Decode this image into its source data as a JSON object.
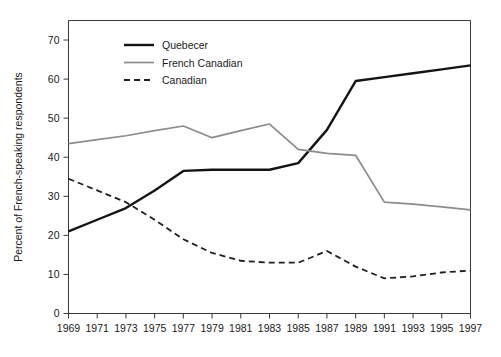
{
  "chart_data": {
    "type": "line",
    "title": "",
    "xlabel": "",
    "ylabel": "Percent of French-speaking respondents",
    "x": [
      1969,
      1971,
      1973,
      1975,
      1977,
      1979,
      1981,
      1983,
      1985,
      1987,
      1989,
      1991,
      1993,
      1995,
      1997
    ],
    "xtick_labels": [
      "1969",
      "1971",
      "1973",
      "1975",
      "1977",
      "1979",
      "1981",
      "1983",
      "1985",
      "1987",
      "1989",
      "1991",
      "1993",
      "1995",
      "1997"
    ],
    "ytick_labels": [
      "0",
      "10",
      "20",
      "30",
      "40",
      "50",
      "60",
      "70"
    ],
    "yticks": [
      0,
      10,
      20,
      30,
      40,
      50,
      60,
      70
    ],
    "xlim": [
      1969,
      1997
    ],
    "ylim": [
      0,
      75
    ],
    "grid": false,
    "legend_position": "top-left-inside",
    "series": [
      {
        "name": "Quebecer",
        "color": "#141414",
        "style": "solid",
        "width": 2.4,
        "values": [
          21,
          24,
          27,
          31.5,
          36.5,
          36.8,
          36.8,
          36.8,
          38.5,
          47,
          59.5,
          60.5,
          61.5,
          62.5,
          63.5
        ]
      },
      {
        "name": "French Canadian",
        "color": "#8c8c8c",
        "style": "solid",
        "width": 1.7,
        "values": [
          43.5,
          44.5,
          45.5,
          46.8,
          48,
          45,
          46.8,
          48.5,
          42,
          41,
          40.5,
          28.5,
          28,
          27.3,
          26.5
        ]
      },
      {
        "name": "Canadian",
        "color": "#1f1f1f",
        "style": "dashed",
        "width": 1.8,
        "values": [
          34.5,
          31.5,
          28.5,
          24,
          19,
          15.5,
          13.5,
          13,
          13,
          16,
          12,
          9,
          9.5,
          10.5,
          11
        ]
      }
    ]
  },
  "legend": {
    "items": [
      {
        "label": "Quebecer"
      },
      {
        "label": "French Canadian"
      },
      {
        "label": "Canadian"
      }
    ]
  },
  "axes": {
    "y_title": "Percent of French-speaking respondents"
  }
}
